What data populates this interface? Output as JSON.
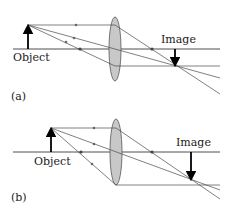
{
  "figure": {
    "panels": [
      {
        "id": "a",
        "panel_label": "(a)",
        "object_label": "Object",
        "image_label": "Image",
        "description": "Object outside 2F; real, inverted, reduced image"
      },
      {
        "id": "b",
        "panel_label": "(b)",
        "object_label": "Object",
        "image_label": "Image",
        "description": "Object between F and 2F; real, inverted, enlarged image"
      }
    ],
    "colors": {
      "lens_fill": "#c8c8c8",
      "ray": "#4a4a4a",
      "arrow": "#000000",
      "axis": "#3a3a3a"
    }
  }
}
